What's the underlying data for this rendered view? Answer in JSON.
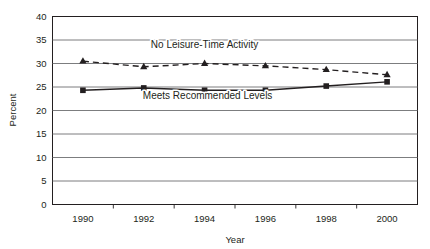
{
  "chart_data": {
    "type": "line",
    "title": "",
    "xlabel": "Year",
    "ylabel": "Percent",
    "x": [
      1990,
      1992,
      1994,
      1996,
      1998,
      2000
    ],
    "xticklabels": [
      "1990",
      "1992",
      "1994",
      "1996",
      "1998",
      "2000"
    ],
    "yticklabels": [
      "0",
      "5",
      "10",
      "15",
      "20",
      "25",
      "30",
      "35",
      "40"
    ],
    "yticks": [
      0,
      5,
      10,
      15,
      20,
      25,
      30,
      35,
      40
    ],
    "ylim": [
      0,
      40
    ],
    "xlim": [
      1989,
      2001
    ],
    "grid": "horizontal",
    "legend": "inline-annotations",
    "series": [
      {
        "name": "No Leisure-Time Activity",
        "values": [
          30.5,
          29.3,
          30.0,
          29.5,
          28.7,
          27.6
        ],
        "linestyle": "dashed",
        "marker": "triangle",
        "color": "#231f20"
      },
      {
        "name": "Meets Recommended Levels",
        "values": [
          24.3,
          24.8,
          24.3,
          24.3,
          25.2,
          26.1
        ],
        "linestyle": "solid",
        "marker": "square",
        "color": "#231f20"
      }
    ],
    "annotations": [
      {
        "text": "No Leisure-Time Activity",
        "x": 1994.0,
        "y": 33.2
      },
      {
        "text": "Meets Recommended Levels",
        "x": 1994.1,
        "y": 22.4
      }
    ],
    "colors": {
      "axis": "#231f20",
      "gridline": "#6d6e71",
      "plot_background": "#ffffff",
      "text": "#231f20"
    }
  }
}
